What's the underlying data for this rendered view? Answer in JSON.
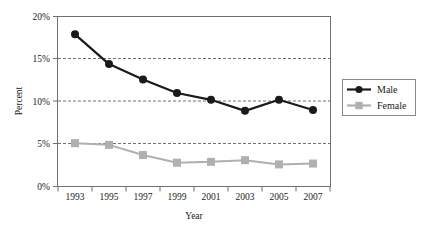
{
  "chart_data": {
    "type": "line",
    "title": "",
    "xlabel": "Year",
    "ylabel": "Percent",
    "categories": [
      "1993",
      "1995",
      "1997",
      "1999",
      "2001",
      "2003",
      "2005",
      "2007"
    ],
    "x": [
      1993,
      1995,
      1997,
      1999,
      2001,
      2003,
      2005,
      2007
    ],
    "series": [
      {
        "name": "Male",
        "color": "#1a1a1a",
        "marker": "circle",
        "values": [
          17.9,
          14.4,
          12.6,
          11.0,
          10.2,
          8.9,
          10.2,
          9.0
        ]
      },
      {
        "name": "Female",
        "color": "#b0b0b0",
        "marker": "square",
        "values": [
          5.1,
          4.9,
          3.7,
          2.8,
          2.9,
          3.1,
          2.6,
          2.7
        ]
      }
    ],
    "ylim": [
      0,
      20
    ],
    "yticks": [
      0,
      5,
      10,
      15,
      20
    ],
    "ytick_labels": [
      "0%",
      "5%",
      "10%",
      "15%",
      "20%"
    ],
    "grid": true,
    "grid_axis": "y",
    "legend_position": "right",
    "legend_entries": [
      "Male",
      "Female"
    ]
  },
  "axis": {
    "y_title": "Percent",
    "x_title": "Year",
    "y_ticks": [
      "20%",
      "15%",
      "10%",
      "5%",
      "0%"
    ],
    "x_ticks": [
      "1993",
      "1995",
      "1997",
      "1999",
      "2001",
      "2003",
      "2005",
      "2007"
    ]
  },
  "legend": {
    "male_label": "Male",
    "female_label": "Female"
  },
  "colors": {
    "male": "#1a1a1a",
    "female": "#b0b0b0",
    "frame": "#6f6f6f",
    "grid": "#4d4d4d",
    "background": "#ffffff"
  }
}
